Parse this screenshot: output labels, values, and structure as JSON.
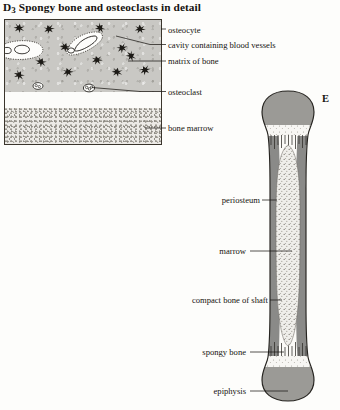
{
  "figure": {
    "title_prefix": "D",
    "title_subscript": "3",
    "title_text": "Spongy bone and osteoclasts in detail",
    "panel_letter": "E"
  },
  "detail_panel": {
    "name": "spongy-bone-detail",
    "regions": [
      {
        "id": "matrix",
        "label": "matrix of bone"
      },
      {
        "id": "cavity",
        "label": "cavity containing blood vessels"
      },
      {
        "id": "marrow",
        "label": "bone marrow"
      }
    ],
    "labels": [
      {
        "id": "osteocyte",
        "text": "osteocyte",
        "x": 168,
        "y": 31
      },
      {
        "id": "cavity",
        "text": "cavity containing blood vessels",
        "x": 168,
        "y": 47
      },
      {
        "id": "matrix",
        "text": "matrix of bone",
        "x": 168,
        "y": 63
      },
      {
        "id": "osteoclast",
        "text": "osteoclast",
        "x": 168,
        "y": 94
      },
      {
        "id": "bone-marrow",
        "text": "bone marrow",
        "x": 168,
        "y": 130
      }
    ]
  },
  "bone_diagram": {
    "name": "long-bone-section",
    "labels": [
      {
        "id": "periosteum",
        "text": "periosteum",
        "x": 216,
        "y": 202
      },
      {
        "id": "marrow",
        "text": "marrow",
        "x": 216,
        "y": 253
      },
      {
        "id": "compact-bone",
        "text": "compact bone of shaft",
        "x": 216,
        "y": 302
      },
      {
        "id": "spongy-bone",
        "text": "spongy bone",
        "x": 216,
        "y": 354
      },
      {
        "id": "epiphysis",
        "text": "epiphysis",
        "x": 216,
        "y": 393
      }
    ]
  },
  "colors": {
    "ink": "#15130f",
    "matrix_gray": "#c9c8c4",
    "compact_bone_gray": "#8a8a88",
    "epiphysis_gray": "#9b9a96",
    "marrow_stipple": "#9a978f",
    "paper": "#fdfdfb"
  }
}
